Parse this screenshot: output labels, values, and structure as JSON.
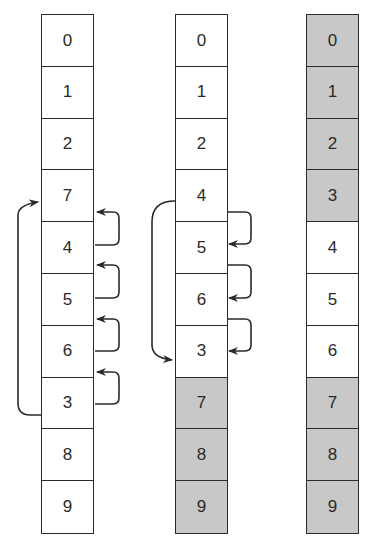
{
  "diagram": {
    "colors": {
      "shaded": "#c8c8c8",
      "plain": "#ffffff",
      "line": "#2a2a2a"
    },
    "columns": [
      {
        "name": "before",
        "cells": [
          {
            "value": "0",
            "shaded": false
          },
          {
            "value": "1",
            "shaded": false
          },
          {
            "value": "2",
            "shaded": false
          },
          {
            "value": "7",
            "shaded": false
          },
          {
            "value": "4",
            "shaded": false
          },
          {
            "value": "5",
            "shaded": false
          },
          {
            "value": "6",
            "shaded": false
          },
          {
            "value": "3",
            "shaded": false
          },
          {
            "value": "8",
            "shaded": false
          },
          {
            "value": "9",
            "shaded": false
          }
        ],
        "arrows": [
          {
            "from": 7,
            "to": 3,
            "side": "left"
          },
          {
            "from": 4,
            "to": 3,
            "side": "right"
          },
          {
            "from": 5,
            "to": 4,
            "side": "right"
          },
          {
            "from": 6,
            "to": 5,
            "side": "right"
          },
          {
            "from": 7,
            "to": 6,
            "side": "right"
          }
        ]
      },
      {
        "name": "middle",
        "cells": [
          {
            "value": "0",
            "shaded": false
          },
          {
            "value": "1",
            "shaded": false
          },
          {
            "value": "2",
            "shaded": false
          },
          {
            "value": "4",
            "shaded": false
          },
          {
            "value": "5",
            "shaded": false
          },
          {
            "value": "6",
            "shaded": false
          },
          {
            "value": "3",
            "shaded": false
          },
          {
            "value": "7",
            "shaded": true
          },
          {
            "value": "8",
            "shaded": true
          },
          {
            "value": "9",
            "shaded": true
          }
        ],
        "arrows": [
          {
            "from": 3,
            "to": 6,
            "side": "left"
          },
          {
            "from": 3,
            "to": 4,
            "side": "right"
          },
          {
            "from": 4,
            "to": 5,
            "side": "right"
          },
          {
            "from": 5,
            "to": 6,
            "side": "right"
          }
        ]
      },
      {
        "name": "after",
        "cells": [
          {
            "value": "0",
            "shaded": true
          },
          {
            "value": "1",
            "shaded": true
          },
          {
            "value": "2",
            "shaded": true
          },
          {
            "value": "3",
            "shaded": true
          },
          {
            "value": "4",
            "shaded": false
          },
          {
            "value": "5",
            "shaded": false
          },
          {
            "value": "6",
            "shaded": false
          },
          {
            "value": "7",
            "shaded": true
          },
          {
            "value": "8",
            "shaded": true
          },
          {
            "value": "9",
            "shaded": true
          }
        ],
        "arrows": []
      }
    ]
  }
}
